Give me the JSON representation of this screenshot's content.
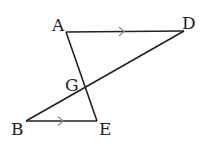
{
  "diagram": {
    "points": {
      "A": {
        "label": "A",
        "x": 66,
        "y": 32
      },
      "D": {
        "label": "D",
        "x": 184,
        "y": 31
      },
      "G": {
        "label": "G",
        "x": 86,
        "y": 87
      },
      "B": {
        "label": "B",
        "x": 26,
        "y": 121
      },
      "E": {
        "label": "E",
        "x": 97,
        "y": 121
      }
    },
    "segments": [
      "AD",
      "AE",
      "BD",
      "BE"
    ],
    "parallel_marks": [
      "AD",
      "BE"
    ],
    "colors": {
      "stroke": "#222222",
      "mark": "#8a8a8a"
    }
  }
}
